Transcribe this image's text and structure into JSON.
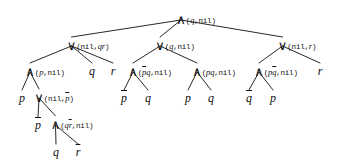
{
  "figure": {
    "type": "binary-expression-tree",
    "ink_color": "#101010",
    "background_color": "#ffffff"
  },
  "symbols": {
    "and": "∧",
    "or": "∨",
    "nil": "nil",
    "open_paren": "(",
    "close_paren": ")",
    "comma": ","
  },
  "nodes": [
    {
      "id": "n0",
      "label": "∧(q,nil)",
      "op": "∧",
      "args": "(q,nil)",
      "level": 0,
      "x": 196,
      "y": 18,
      "kind": "internal"
    },
    {
      "id": "n1",
      "label": "∨(nil,qr)",
      "op": "∨",
      "args": "(nil,qr)",
      "level": 1,
      "x": 88,
      "y": 44,
      "kind": "internal"
    },
    {
      "id": "n2",
      "label": "∨(q,nil)",
      "op": "∨",
      "args": "(q,nil)",
      "level": 1,
      "x": 175,
      "y": 44,
      "kind": "internal"
    },
    {
      "id": "n3",
      "label": "∨(nil,r)",
      "op": "∨",
      "args": "(nil,r)",
      "level": 1,
      "x": 297,
      "y": 44,
      "kind": "internal"
    },
    {
      "id": "n4",
      "label": "∧(p,nil)",
      "op": "∧",
      "args": "(p,nil)",
      "level": 2,
      "x": 45,
      "y": 70,
      "kind": "internal"
    },
    {
      "id": "n5",
      "label": "q",
      "level": 2,
      "x": 92,
      "y": 70,
      "kind": "leaf"
    },
    {
      "id": "n6",
      "label": "r",
      "level": 2,
      "x": 113,
      "y": 70,
      "kind": "leaf"
    },
    {
      "id": "n7",
      "label": "∧(p̄q,nil)",
      "op": "∧",
      "args": "(p̄q,nil)",
      "level": 2,
      "x": 150,
      "y": 70,
      "kind": "internal"
    },
    {
      "id": "n8",
      "label": "∧(pq,nil)",
      "op": "∧",
      "args": "(pq,nil)",
      "level": 2,
      "x": 214,
      "y": 70,
      "kind": "internal"
    },
    {
      "id": "n9",
      "label": "∧(pq̄,nil)",
      "op": "∧",
      "args": "(pq̄,nil)",
      "level": 2,
      "x": 276,
      "y": 70,
      "kind": "internal"
    },
    {
      "id": "n10",
      "label": "r",
      "level": 2,
      "x": 320,
      "y": 70,
      "kind": "leaf"
    },
    {
      "id": "n11",
      "label": "p",
      "level": 3,
      "x": 22,
      "y": 97,
      "kind": "leaf"
    },
    {
      "id": "n12",
      "label": "∨(nil,p̄)",
      "op": "∨",
      "args": "(nil,p̄)",
      "level": 3,
      "x": 54,
      "y": 96,
      "kind": "internal"
    },
    {
      "id": "n13",
      "label": "p̄",
      "level": 3,
      "x": 124,
      "y": 97,
      "kind": "leaf"
    },
    {
      "id": "n14",
      "label": "q",
      "level": 3,
      "x": 148,
      "y": 97,
      "kind": "leaf"
    },
    {
      "id": "n15",
      "label": "p",
      "level": 3,
      "x": 188,
      "y": 97,
      "kind": "leaf"
    },
    {
      "id": "n16",
      "label": "q",
      "level": 3,
      "x": 211,
      "y": 97,
      "kind": "leaf"
    },
    {
      "id": "n17",
      "label": "q̄",
      "level": 3,
      "x": 249,
      "y": 97,
      "kind": "leaf"
    },
    {
      "id": "n18",
      "label": "p",
      "level": 3,
      "x": 273,
      "y": 97,
      "kind": "leaf"
    },
    {
      "id": "n19",
      "label": "p̄",
      "level": 4,
      "x": 38,
      "y": 124,
      "kind": "leaf"
    },
    {
      "id": "n20",
      "label": "∧(qr̄,nil)",
      "op": "∧",
      "args": "(qr̄,nil)",
      "level": 4,
      "x": 72,
      "y": 123,
      "kind": "internal"
    },
    {
      "id": "n21",
      "label": "q",
      "level": 5,
      "x": 56,
      "y": 151,
      "kind": "leaf"
    },
    {
      "id": "n22",
      "label": "r̄",
      "level": 5,
      "x": 78,
      "y": 151,
      "kind": "leaf"
    }
  ],
  "edges": [
    {
      "from": "n0",
      "to": "n1"
    },
    {
      "from": "n0",
      "to": "n2"
    },
    {
      "from": "n0",
      "to": "n3"
    },
    {
      "from": "n1",
      "to": "n4"
    },
    {
      "from": "n1",
      "to": "n5"
    },
    {
      "from": "n1",
      "to": "n6"
    },
    {
      "from": "n2",
      "to": "n7"
    },
    {
      "from": "n2",
      "to": "n8"
    },
    {
      "from": "n3",
      "to": "n9"
    },
    {
      "from": "n3",
      "to": "n10"
    },
    {
      "from": "n4",
      "to": "n11"
    },
    {
      "from": "n4",
      "to": "n12"
    },
    {
      "from": "n7",
      "to": "n13"
    },
    {
      "from": "n7",
      "to": "n14"
    },
    {
      "from": "n8",
      "to": "n15"
    },
    {
      "from": "n8",
      "to": "n16"
    },
    {
      "from": "n9",
      "to": "n17"
    },
    {
      "from": "n9",
      "to": "n18"
    },
    {
      "from": "n12",
      "to": "n19"
    },
    {
      "from": "n12",
      "to": "n20"
    },
    {
      "from": "n20",
      "to": "n21"
    },
    {
      "from": "n20",
      "to": "n22"
    }
  ]
}
